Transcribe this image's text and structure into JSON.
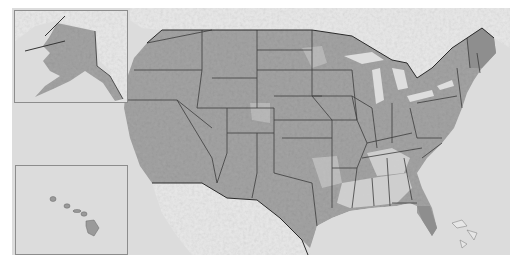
{
  "map": {
    "type": "shaded-relief choropleth",
    "subject": "United States",
    "insets": [
      "Alaska",
      "Hawaii"
    ],
    "colors": {
      "ocean": "#dcdcdc",
      "foreign_land": "#e9e9e9",
      "us_land_dark": "#9a9a9a",
      "us_land_mid": "#a8a8a8",
      "us_land_light": "#d6d6d6",
      "state_border": "#3c3c3c",
      "inset_border": "#8c8c8c"
    }
  }
}
